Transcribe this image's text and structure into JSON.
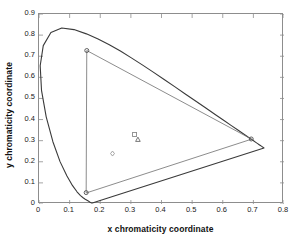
{
  "chart_data": {
    "type": "line",
    "title": "",
    "xlabel": "x chromaticity coordinate",
    "ylabel": "y chromaticity coordinate",
    "xlim": [
      0,
      0.8
    ],
    "ylim": [
      0,
      0.9
    ],
    "xticks": [
      "0",
      "0.1",
      "0.2",
      "0.3",
      "0.4",
      "0.5",
      "0.6",
      "0.7",
      "0.8"
    ],
    "xtick_values": [
      0,
      0.1,
      0.2,
      0.3,
      0.4,
      0.5,
      0.6,
      0.7,
      0.8
    ],
    "yticks": [
      "0",
      "0.1",
      "0.2",
      "0.3",
      "0.4",
      "0.5",
      "0.6",
      "0.7",
      "0.8",
      "0.9"
    ],
    "ytick_values": [
      0,
      0.1,
      0.2,
      0.3,
      0.4,
      0.5,
      0.6,
      0.7,
      0.8,
      0.9
    ],
    "grid": false,
    "legend": "none",
    "series": [
      {
        "name": "spectral-locus",
        "type": "line",
        "closed": true,
        "color": "#3a3a3a",
        "linewidth": 1.1,
        "points": [
          [
            0.1741,
            0.005
          ],
          [
            0.174,
            0.005
          ],
          [
            0.1738,
            0.0049
          ],
          [
            0.1736,
            0.0049
          ],
          [
            0.1733,
            0.0048
          ],
          [
            0.173,
            0.0048
          ],
          [
            0.1726,
            0.0048
          ],
          [
            0.1721,
            0.0048
          ],
          [
            0.1714,
            0.0051
          ],
          [
            0.1703,
            0.0058
          ],
          [
            0.1689,
            0.0069
          ],
          [
            0.1669,
            0.0086
          ],
          [
            0.1644,
            0.0109
          ],
          [
            0.1611,
            0.0138
          ],
          [
            0.1566,
            0.0177
          ],
          [
            0.151,
            0.0227
          ],
          [
            0.144,
            0.0297
          ],
          [
            0.1355,
            0.0399
          ],
          [
            0.1241,
            0.0578
          ],
          [
            0.1096,
            0.0868
          ],
          [
            0.0913,
            0.1327
          ],
          [
            0.0687,
            0.2007
          ],
          [
            0.0454,
            0.295
          ],
          [
            0.0235,
            0.4127
          ],
          [
            0.0082,
            0.5384
          ],
          [
            0.0039,
            0.6548
          ],
          [
            0.0139,
            0.7502
          ],
          [
            0.0389,
            0.812
          ],
          [
            0.0743,
            0.8338
          ],
          [
            0.1142,
            0.8262
          ],
          [
            0.1547,
            0.8059
          ],
          [
            0.1929,
            0.7816
          ],
          [
            0.2296,
            0.7543
          ],
          [
            0.2658,
            0.7243
          ],
          [
            0.3016,
            0.6923
          ],
          [
            0.3373,
            0.6589
          ],
          [
            0.3731,
            0.6245
          ],
          [
            0.4087,
            0.5896
          ],
          [
            0.4441,
            0.5547
          ],
          [
            0.4788,
            0.5202
          ],
          [
            0.5125,
            0.4866
          ],
          [
            0.5448,
            0.4544
          ],
          [
            0.5752,
            0.4242
          ],
          [
            0.6029,
            0.3965
          ],
          [
            0.627,
            0.3725
          ],
          [
            0.6482,
            0.3514
          ],
          [
            0.6658,
            0.334
          ],
          [
            0.6801,
            0.3197
          ],
          [
            0.6915,
            0.3083
          ],
          [
            0.7006,
            0.2993
          ],
          [
            0.7079,
            0.292
          ],
          [
            0.714,
            0.2859
          ],
          [
            0.719,
            0.2809
          ],
          [
            0.723,
            0.277
          ],
          [
            0.726,
            0.274
          ],
          [
            0.7283,
            0.2717
          ],
          [
            0.73,
            0.27
          ],
          [
            0.7311,
            0.2689
          ],
          [
            0.732,
            0.268
          ],
          [
            0.7327,
            0.2673
          ],
          [
            0.7334,
            0.2666
          ],
          [
            0.734,
            0.266
          ],
          [
            0.7344,
            0.2656
          ],
          [
            0.7346,
            0.2654
          ],
          [
            0.7347,
            0.2653
          ]
        ]
      },
      {
        "name": "device-gamut-triangle",
        "type": "line",
        "closed": true,
        "color": "#6e6e6e",
        "linewidth": 0.8,
        "points": [
          [
            0.154,
            0.054
          ],
          [
            0.156,
            0.727
          ],
          [
            0.693,
            0.308
          ]
        ]
      }
    ],
    "markers": [
      {
        "name": "gamut-vertex-blue",
        "shape": "circle",
        "x": 0.154,
        "y": 0.054,
        "color": "#4d4d4d",
        "size": 4
      },
      {
        "name": "gamut-vertex-green",
        "shape": "circle",
        "x": 0.156,
        "y": 0.727,
        "color": "#4d4d4d",
        "size": 4
      },
      {
        "name": "gamut-vertex-red",
        "shape": "circle",
        "x": 0.693,
        "y": 0.308,
        "color": "#4d4d4d",
        "size": 4
      },
      {
        "name": "white-point-square",
        "shape": "square",
        "x": 0.312,
        "y": 0.329,
        "color": "#8a8a8a",
        "size": 4
      },
      {
        "name": "white-point-triangle",
        "shape": "triangle",
        "x": 0.323,
        "y": 0.305,
        "color": "#6a6a6a",
        "size": 5
      },
      {
        "name": "white-point-diamond",
        "shape": "diamond",
        "x": 0.24,
        "y": 0.239,
        "color": "#9a9a9a",
        "size": 5
      }
    ]
  }
}
